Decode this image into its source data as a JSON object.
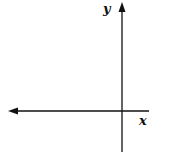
{
  "diagram": {
    "type": "coordinate-axes",
    "axes": {
      "x_label": "x",
      "y_label": "y",
      "x_axis_arrow": "left",
      "y_axis_arrow": "up"
    },
    "colors": {
      "axis": "#111111",
      "background": "#ffffff"
    }
  }
}
